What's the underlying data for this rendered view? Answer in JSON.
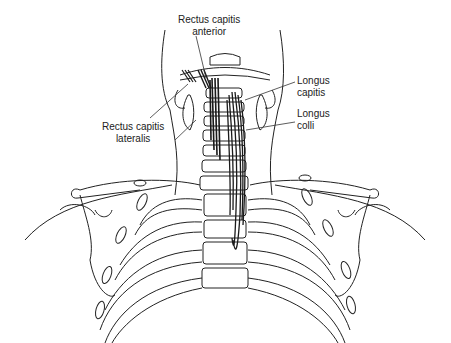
{
  "diagram": {
    "labels": [
      {
        "id": "rectus-capitis-anterior",
        "line1": "Rectus capitis",
        "line2": "anterior"
      },
      {
        "id": "rectus-capitis-lateralis",
        "line1": "Rectus capitis",
        "line2": "lateralis"
      },
      {
        "id": "longus-capitis",
        "line1": "Longus",
        "line2": "capitis"
      },
      {
        "id": "longus-colli",
        "line1": "Longus",
        "line2": "colli"
      }
    ],
    "colors": {
      "line": "#222222",
      "muscle": "#1a1a1a",
      "background": "#ffffff"
    }
  }
}
